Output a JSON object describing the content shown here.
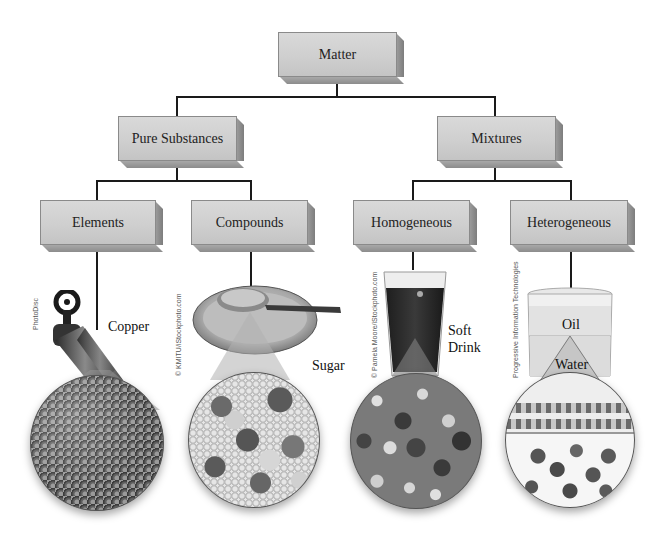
{
  "diagram": {
    "title": "Matter",
    "nodes": {
      "root": {
        "label": "Matter"
      },
      "pure": {
        "label": "Pure Substances"
      },
      "mixtures": {
        "label": "Mixtures"
      },
      "elements": {
        "label": "Elements"
      },
      "compounds": {
        "label": "Compounds"
      },
      "homogeneous": {
        "label": "Homogeneous"
      },
      "heterogeneous": {
        "label": "Heterogeneous"
      }
    },
    "examples": {
      "elements": {
        "label": "Copper",
        "credit": "PhotoDisc"
      },
      "compounds": {
        "label": "Sugar",
        "credit": "© KMITU/iStockphoto.com"
      },
      "homogeneous": {
        "label_line1": "Soft",
        "label_line2": "Drink",
        "credit": "© Pamela Moore/iStockphoto.com"
      },
      "heterogeneous": {
        "label_top": "Oil",
        "label_bottom": "Water",
        "credit": "Progressive Information Technologies"
      }
    },
    "colors": {
      "box_face": "#d0d0d0",
      "box_side": "#8c8c8c",
      "connector": "#1a1a1a"
    }
  }
}
